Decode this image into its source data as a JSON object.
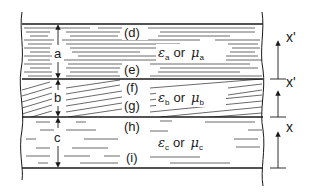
{
  "diagram": {
    "layers": [
      {
        "id": "a",
        "thickness_label": "a",
        "top_interface": "(d)",
        "bottom_interface": "(e)",
        "property": {
          "eps": "ε",
          "eps_sub": "a",
          "or": "or",
          "mu": "μ",
          "mu_sub": "a"
        },
        "hatch": "horizontal"
      },
      {
        "id": "b",
        "thickness_label": "b",
        "top_interface": "(f)",
        "bottom_interface": "(g)",
        "property": {
          "eps": "ε",
          "eps_sub": "b",
          "or": "or",
          "mu": "μ",
          "mu_sub": "b"
        },
        "hatch": "diagonal"
      },
      {
        "id": "c",
        "thickness_label": "c",
        "top_interface": "(h)",
        "bottom_interface": "(i)",
        "property": {
          "eps": "ε",
          "eps_sub": "c",
          "or": "or",
          "mu": "μ",
          "mu_sub": "c"
        },
        "hatch": "horizontal-sparse"
      }
    ],
    "coordinate_axes": [
      {
        "label": "x'",
        "layer": "a"
      },
      {
        "label": "x'",
        "layer": "b"
      },
      {
        "label": "x",
        "layer": "c"
      }
    ],
    "colors": {
      "ink": "#1a1a1a",
      "background": "#ffffff"
    }
  }
}
